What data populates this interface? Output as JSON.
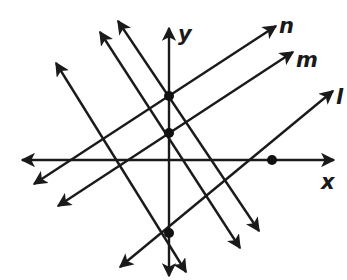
{
  "diagram": {
    "type": "coordinate-plane-lines",
    "axes": {
      "x_label": "x",
      "y_label": "y"
    },
    "line_labels": [
      "n",
      "m",
      "l"
    ],
    "colors": {
      "stroke": "#1a1a1a",
      "background": "#ffffff"
    }
  }
}
